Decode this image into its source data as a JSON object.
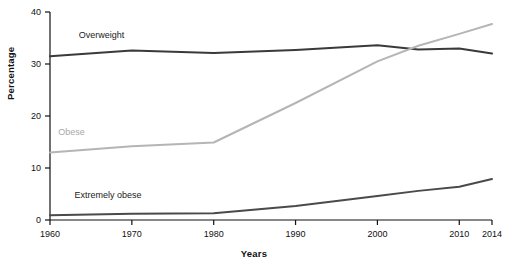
{
  "chart_data": {
    "type": "line",
    "title": "",
    "xlabel": "Years",
    "ylabel": "Percentage",
    "xlim": [
      1960,
      2014
    ],
    "ylim": [
      0,
      40
    ],
    "xticks": [
      "1960",
      "1970",
      "1980",
      "1990",
      "2000",
      "2010",
      "2014"
    ],
    "yticks": [
      "0",
      "10",
      "20",
      "30",
      "40"
    ],
    "grid": false,
    "legend_position": "inline-labels",
    "x": [
      1960,
      1970,
      1980,
      1990,
      2000,
      2005,
      2010,
      2014
    ],
    "series": [
      {
        "name": "Overweight",
        "color": "#3a3a3a",
        "values": [
          31.5,
          32.6,
          32.1,
          32.7,
          33.6,
          32.8,
          33.0,
          32.0
        ]
      },
      {
        "name": "Obese",
        "color": "#b5b5b5",
        "values": [
          13.0,
          14.2,
          14.9,
          22.5,
          30.5,
          33.5,
          35.8,
          37.7
        ]
      },
      {
        "name": "Extremely obese",
        "color": "#4a4a4a",
        "values": [
          0.9,
          1.2,
          1.3,
          2.7,
          4.6,
          5.6,
          6.4,
          7.9
        ]
      }
    ],
    "annotations": [
      {
        "text": "Overweight",
        "x": 1963.5,
        "y": 35.0,
        "color": "#222222"
      },
      {
        "text": "Obese",
        "x": 1961.0,
        "y": 16.3,
        "color": "#a8a8a8"
      },
      {
        "text": "Extremely obese",
        "x": 1963.0,
        "y": 4.3,
        "color": "#222222"
      }
    ]
  }
}
